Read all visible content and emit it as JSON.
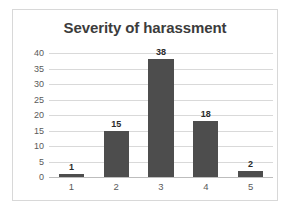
{
  "chart_data": {
    "type": "bar",
    "title": "Severity of harassment",
    "categories": [
      "1",
      "2",
      "3",
      "4",
      "5"
    ],
    "values": [
      1,
      15,
      38,
      18,
      2
    ],
    "data_labels": [
      "1",
      "15",
      "38",
      "18",
      "2"
    ],
    "xlabel": "",
    "ylabel": "",
    "ylim": [
      0,
      40
    ],
    "yticks": [
      40,
      35,
      30,
      25,
      20,
      15,
      10,
      5,
      0
    ],
    "ytick_labels": [
      "40",
      "35",
      "30",
      "25",
      "20",
      "15",
      "10",
      "5",
      "0"
    ],
    "grid": true,
    "grid_axis": "y",
    "legend": false,
    "series": [
      {
        "name": "Severity",
        "values": [
          1,
          15,
          38,
          18,
          2
        ]
      }
    ],
    "colors": {
      "bar": "#4d4d4d",
      "gridline": "#d9d9d9",
      "baseline": "#bdbdbd",
      "title_text": "#3c3c3c",
      "tick_text": "#5a5a5a",
      "label_text": "#2b2b2b",
      "plot_background": "#ffffff",
      "frame_border": "#d8d8d8"
    }
  }
}
